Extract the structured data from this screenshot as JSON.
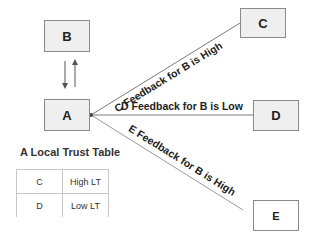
{
  "nodes": {
    "a": {
      "label": "A"
    },
    "b": {
      "label": "B"
    },
    "c": {
      "label": "C"
    },
    "d": {
      "label": "D"
    },
    "e": {
      "label": "E"
    }
  },
  "edges": {
    "a_to_c": {
      "label": "C Feedback for B is High"
    },
    "a_to_d": {
      "label": "D Feedback for B is Low"
    },
    "a_to_e": {
      "label": "E Feedback for B is High"
    }
  },
  "trust_table": {
    "title": "A Local Trust Table",
    "rows": [
      {
        "node": "C",
        "value": "High LT"
      },
      {
        "node": "D",
        "value": "Low LT"
      }
    ]
  },
  "colors": {
    "node_fill": "#efefef",
    "node_border": "#8a8a8a",
    "edge": "#7a7a7a",
    "text": "#222222"
  }
}
